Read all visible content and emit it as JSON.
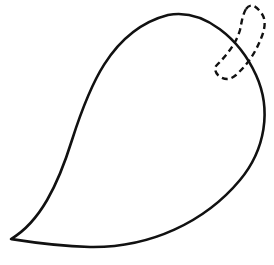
{
  "figure": {
    "stroke_color": "#111111",
    "background": "#ffffff",
    "leaf": {
      "label": "leaf outline",
      "style": "solid"
    },
    "stem": {
      "label": "stem",
      "style": "dashed"
    }
  }
}
